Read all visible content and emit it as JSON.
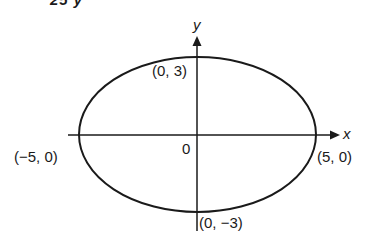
{
  "figure": {
    "cropped_header": "25      y",
    "axes": {
      "x_label": "x",
      "y_label": "y",
      "origin_label": "0"
    },
    "points": {
      "top": "(0, 3)",
      "bottom": "(0, −3)",
      "left": "(−5, 0)",
      "right": "(5, 0)"
    },
    "ellipse": {
      "center": [
        0,
        0
      ],
      "semi_major_x": 5,
      "semi_minor_y": 3,
      "equation": "x^2/25 + y^2/9 = 1"
    },
    "colors": {
      "stroke": "#1a1a1a",
      "background": "#ffffff"
    }
  }
}
